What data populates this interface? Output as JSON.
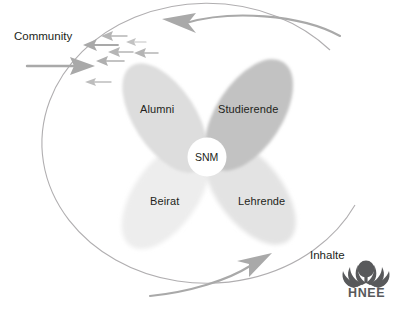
{
  "diagram": {
    "title_center": "SNM",
    "petals": [
      {
        "id": "alumni",
        "label": "Alumni",
        "color": "#dcdcdc",
        "position": "upper-left"
      },
      {
        "id": "studierende",
        "label": "Studierende",
        "color": "#bfbfbf",
        "position": "upper-right"
      },
      {
        "id": "beirat",
        "label": "Beirat",
        "color": "#ececec",
        "position": "lower-left"
      },
      {
        "id": "lehrende",
        "label": "Lehrende",
        "color": "#e2e2e2",
        "position": "lower-right"
      }
    ],
    "outer_labels": [
      {
        "id": "community",
        "label": "Community",
        "position": "left-top"
      },
      {
        "id": "inhalte",
        "label": "Inhalte",
        "position": "right-bottom"
      }
    ],
    "cycle_arrows": [
      {
        "id": "top-arrow",
        "direction": "counter-clockwise-left",
        "color": "#a6a6a6"
      },
      {
        "id": "bottom-arrow",
        "direction": "counter-clockwise-right",
        "color": "#a6a6a6"
      }
    ],
    "flow_arrows": {
      "count": 8,
      "color": "#a6a6a6",
      "description": "cluster of small left-pointing arrows plus one large right-pointing arrow"
    },
    "circle_stroke": "#b0aeb0"
  },
  "logo": {
    "wordmark": "HNEE",
    "mark_name": "hnee-tree-icon",
    "color": "#58595b"
  }
}
